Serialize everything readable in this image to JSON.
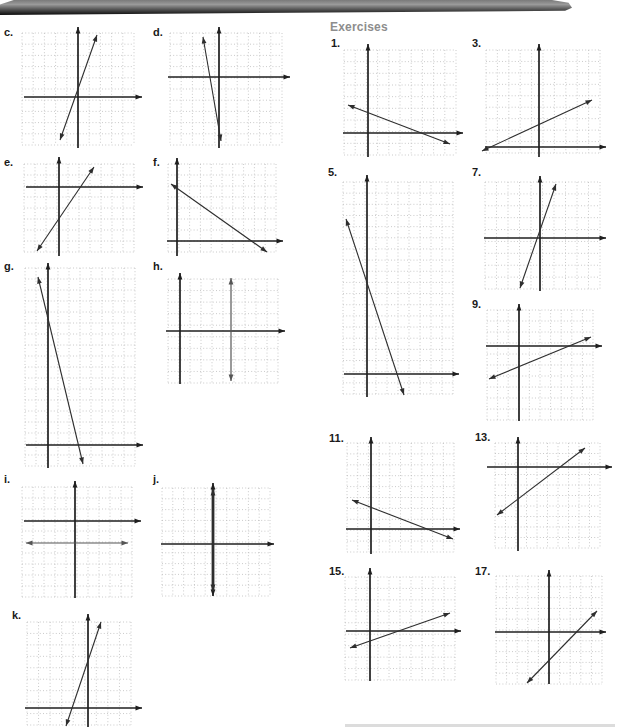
{
  "page": {
    "width": 618,
    "height": 727,
    "background": "#ffffff"
  },
  "header_band": {
    "type": "scanned-page-header",
    "gradient_top": "#9a9a9a",
    "gradient_bottom": "#0b0b0b"
  },
  "headings": {
    "exercises": "Exercises",
    "exercises_color": "#8d8d8d"
  },
  "colors": {
    "axis": "#1f1f1f",
    "plotted_line": "#2e2e2e",
    "secondary_line": "#555555",
    "grid_dot": "#bdbdbd",
    "label": "#1a1a1a"
  },
  "graphs": [
    {
      "label": "c.",
      "lx": 4,
      "ly": 26,
      "grid": {
        "x": 22,
        "y": 33,
        "w": 112,
        "h": 112,
        "cols": 10,
        "rows": 10
      },
      "xaxis": {
        "y": 97,
        "x1": 24,
        "x2": 142,
        "arrow_left": false,
        "arrow_right": true
      },
      "yaxis": {
        "x": 78,
        "y1": 27,
        "y2": 148,
        "arrow_top": true,
        "arrow_bottom": false
      },
      "lines": [
        {
          "x1": 60,
          "y1": 140,
          "x2": 97,
          "y2": 35,
          "arrow_start": true,
          "arrow_end": true,
          "w": 1.1,
          "tone": "plotted_line"
        }
      ]
    },
    {
      "label": "d.",
      "lx": 153,
      "ly": 26,
      "grid": {
        "x": 170,
        "y": 33,
        "w": 112,
        "h": 112,
        "cols": 10,
        "rows": 10
      },
      "xaxis": {
        "y": 77,
        "x1": 168,
        "x2": 290,
        "arrow_left": false,
        "arrow_right": true
      },
      "yaxis": {
        "x": 219,
        "y1": 27,
        "y2": 148,
        "arrow_top": true,
        "arrow_bottom": false
      },
      "lines": [
        {
          "x1": 203,
          "y1": 37,
          "x2": 221,
          "y2": 141,
          "arrow_start": true,
          "arrow_end": true,
          "w": 1.1,
          "tone": "plotted_line"
        }
      ]
    },
    {
      "label": "e.",
      "lx": 4,
      "ly": 156,
      "grid": {
        "x": 24,
        "y": 164,
        "w": 110,
        "h": 88,
        "cols": 10,
        "rows": 8
      },
      "xaxis": {
        "y": 187,
        "x1": 26,
        "x2": 143,
        "arrow_left": false,
        "arrow_right": true
      },
      "yaxis": {
        "x": 59,
        "y1": 157,
        "y2": 256,
        "arrow_top": true,
        "arrow_bottom": false
      },
      "lines": [
        {
          "x1": 37,
          "y1": 251,
          "x2": 94,
          "y2": 167,
          "arrow_start": true,
          "arrow_end": true,
          "w": 1.1,
          "tone": "plotted_line"
        }
      ]
    },
    {
      "label": "f.",
      "lx": 153,
      "ly": 156,
      "grid": {
        "x": 168,
        "y": 164,
        "w": 108,
        "h": 88,
        "cols": 10,
        "rows": 8
      },
      "xaxis": {
        "y": 241,
        "x1": 167,
        "x2": 283,
        "arrow_left": false,
        "arrow_right": true
      },
      "yaxis": {
        "x": 177,
        "y1": 158,
        "y2": 256,
        "arrow_top": true,
        "arrow_bottom": false
      },
      "lines": [
        {
          "x1": 171,
          "y1": 184,
          "x2": 267,
          "y2": 252,
          "arrow_start": true,
          "arrow_end": true,
          "w": 1.1,
          "tone": "plotted_line"
        }
      ]
    },
    {
      "label": "g.",
      "lx": 4,
      "ly": 260,
      "grid": {
        "x": 25,
        "y": 268,
        "w": 110,
        "h": 198,
        "cols": 10,
        "rows": 18
      },
      "xaxis": {
        "y": 445,
        "x1": 26,
        "x2": 143,
        "arrow_left": false,
        "arrow_right": true
      },
      "yaxis": {
        "x": 48,
        "y1": 263,
        "y2": 468,
        "arrow_top": true,
        "arrow_bottom": false
      },
      "lines": [
        {
          "x1": 38,
          "y1": 277,
          "x2": 83,
          "y2": 464,
          "arrow_start": true,
          "arrow_end": true,
          "w": 1.1,
          "tone": "plotted_line"
        }
      ]
    },
    {
      "label": "h.",
      "lx": 153,
      "ly": 260,
      "grid": {
        "x": 168,
        "y": 279,
        "w": 110,
        "h": 104,
        "cols": 10,
        "rows": 9
      },
      "xaxis": {
        "y": 331,
        "x1": 166,
        "x2": 285,
        "arrow_left": false,
        "arrow_right": true
      },
      "yaxis": {
        "x": 180,
        "y1": 273,
        "y2": 384,
        "arrow_top": true,
        "arrow_bottom": false
      },
      "lines": [
        {
          "x1": 231,
          "y1": 278,
          "x2": 231,
          "y2": 381,
          "arrow_start": true,
          "arrow_end": true,
          "w": 1.2,
          "tone": "secondary_line"
        }
      ]
    },
    {
      "label": "i.",
      "lx": 4,
      "ly": 473,
      "grid": {
        "x": 22,
        "y": 487,
        "w": 110,
        "h": 110,
        "cols": 10,
        "rows": 10
      },
      "xaxis": {
        "y": 521,
        "x1": 24,
        "x2": 141,
        "arrow_left": false,
        "arrow_right": true
      },
      "yaxis": {
        "x": 75,
        "y1": 481,
        "y2": 598,
        "arrow_top": true,
        "arrow_bottom": false
      },
      "lines": [
        {
          "x1": 26,
          "y1": 543,
          "x2": 128,
          "y2": 543,
          "arrow_start": true,
          "arrow_end": true,
          "w": 1.2,
          "tone": "secondary_line"
        }
      ]
    },
    {
      "label": "j.",
      "lx": 153,
      "ly": 473,
      "grid": {
        "x": 162,
        "y": 488,
        "w": 108,
        "h": 108,
        "cols": 10,
        "rows": 10
      },
      "xaxis": {
        "y": 544,
        "x1": 161,
        "x2": 274,
        "arrow_left": false,
        "arrow_right": true
      },
      "yaxis": {
        "x": 213,
        "y1": 483,
        "y2": 596,
        "arrow_top": true,
        "arrow_bottom": true
      },
      "lines": [
        {
          "x1": 213,
          "y1": 489,
          "x2": 213,
          "y2": 591,
          "arrow_start": true,
          "arrow_end": true,
          "w": 2.8,
          "tone": "plotted_line"
        }
      ]
    },
    {
      "label": "k.",
      "lx": 12,
      "ly": 609,
      "grid": {
        "x": 27,
        "y": 622,
        "w": 104,
        "h": 103,
        "cols": 9,
        "rows": 9
      },
      "xaxis": {
        "y": 708,
        "x1": 25,
        "x2": 142,
        "arrow_left": false,
        "arrow_right": true
      },
      "yaxis": {
        "x": 88,
        "y1": 614,
        "y2": 727,
        "arrow_top": true,
        "arrow_bottom": false
      },
      "lines": [
        {
          "x1": 66,
          "y1": 726,
          "x2": 101,
          "y2": 622,
          "arrow_start": true,
          "arrow_end": true,
          "w": 1.1,
          "tone": "plotted_line"
        }
      ]
    },
    {
      "label": "1.",
      "lx": 331,
      "ly": 37,
      "grid": {
        "x": 344,
        "y": 50,
        "w": 112,
        "h": 105,
        "cols": 10,
        "rows": 9
      },
      "xaxis": {
        "y": 133,
        "x1": 343,
        "x2": 463,
        "arrow_left": false,
        "arrow_right": true
      },
      "yaxis": {
        "x": 368,
        "y1": 44,
        "y2": 157,
        "arrow_top": true,
        "arrow_bottom": false
      },
      "lines": [
        {
          "x1": 348,
          "y1": 105,
          "x2": 450,
          "y2": 144,
          "arrow_start": true,
          "arrow_end": true,
          "w": 1.1,
          "tone": "plotted_line"
        }
      ]
    },
    {
      "label": "3.",
      "lx": 472,
      "ly": 37,
      "grid": {
        "x": 486,
        "y": 50,
        "w": 114,
        "h": 103,
        "cols": 10,
        "rows": 9
      },
      "xaxis": {
        "y": 147,
        "x1": 485,
        "x2": 606,
        "arrow_left": false,
        "arrow_right": true
      },
      "yaxis": {
        "x": 539,
        "y1": 44,
        "y2": 157,
        "arrow_top": true,
        "arrow_bottom": false
      },
      "lines": [
        {
          "x1": 482,
          "y1": 151,
          "x2": 592,
          "y2": 100,
          "arrow_start": true,
          "arrow_end": true,
          "w": 1.1,
          "tone": "plotted_line"
        }
      ]
    },
    {
      "label": "5.",
      "lx": 328,
      "ly": 166,
      "grid": {
        "x": 343,
        "y": 182,
        "w": 110,
        "h": 212,
        "cols": 10,
        "rows": 19
      },
      "xaxis": {
        "y": 374,
        "x1": 344,
        "x2": 459,
        "arrow_left": false,
        "arrow_right": true
      },
      "yaxis": {
        "x": 367,
        "y1": 175,
        "y2": 397,
        "arrow_top": true,
        "arrow_bottom": false
      },
      "lines": [
        {
          "x1": 346,
          "y1": 219,
          "x2": 404,
          "y2": 395,
          "arrow_start": true,
          "arrow_end": true,
          "w": 1.1,
          "tone": "plotted_line"
        }
      ]
    },
    {
      "label": "7.",
      "lx": 472,
      "ly": 166,
      "grid": {
        "x": 485,
        "y": 182,
        "w": 115,
        "h": 107,
        "cols": 10,
        "rows": 9
      },
      "xaxis": {
        "y": 238,
        "x1": 484,
        "x2": 606,
        "arrow_left": false,
        "arrow_right": true
      },
      "yaxis": {
        "x": 540,
        "y1": 176,
        "y2": 291,
        "arrow_top": true,
        "arrow_bottom": false
      },
      "lines": [
        {
          "x1": 520,
          "y1": 288,
          "x2": 556,
          "y2": 184,
          "arrow_start": true,
          "arrow_end": true,
          "w": 1.1,
          "tone": "plotted_line"
        }
      ]
    },
    {
      "label": "9.",
      "lx": 472,
      "ly": 298,
      "grid": {
        "x": 487,
        "y": 310,
        "w": 106,
        "h": 110,
        "cols": 10,
        "rows": 10
      },
      "xaxis": {
        "y": 346,
        "x1": 486,
        "x2": 602,
        "arrow_left": false,
        "arrow_right": true
      },
      "yaxis": {
        "x": 519,
        "y1": 304,
        "y2": 421,
        "arrow_top": true,
        "arrow_bottom": false
      },
      "lines": [
        {
          "x1": 489,
          "y1": 379,
          "x2": 591,
          "y2": 337,
          "arrow_start": true,
          "arrow_end": true,
          "w": 1.1,
          "tone": "plotted_line"
        }
      ]
    },
    {
      "label": "11.",
      "lx": 329,
      "ly": 432,
      "grid": {
        "x": 347,
        "y": 443,
        "w": 107,
        "h": 109,
        "cols": 10,
        "rows": 10
      },
      "xaxis": {
        "y": 529,
        "x1": 346,
        "x2": 460,
        "arrow_left": false,
        "arrow_right": true
      },
      "yaxis": {
        "x": 371,
        "y1": 437,
        "y2": 554,
        "arrow_top": true,
        "arrow_bottom": false
      },
      "lines": [
        {
          "x1": 352,
          "y1": 500,
          "x2": 453,
          "y2": 539,
          "arrow_start": true,
          "arrow_end": true,
          "w": 1.1,
          "tone": "plotted_line"
        }
      ]
    },
    {
      "label": "13.",
      "lx": 475,
      "ly": 431,
      "grid": {
        "x": 495,
        "y": 443,
        "w": 105,
        "h": 105,
        "cols": 10,
        "rows": 10
      },
      "xaxis": {
        "y": 467,
        "x1": 487,
        "x2": 612,
        "arrow_left": false,
        "arrow_right": true
      },
      "yaxis": {
        "x": 518,
        "y1": 437,
        "y2": 551,
        "arrow_top": true,
        "arrow_bottom": false
      },
      "lines": [
        {
          "x1": 497,
          "y1": 515,
          "x2": 585,
          "y2": 448,
          "arrow_start": true,
          "arrow_end": true,
          "w": 1.1,
          "tone": "plotted_line"
        }
      ]
    },
    {
      "label": "15.",
      "lx": 329,
      "ly": 565,
      "grid": {
        "x": 345,
        "y": 577,
        "w": 110,
        "h": 103,
        "cols": 10,
        "rows": 9
      },
      "xaxis": {
        "y": 631,
        "x1": 346,
        "x2": 461,
        "arrow_left": false,
        "arrow_right": true
      },
      "yaxis": {
        "x": 370,
        "y1": 568,
        "y2": 681,
        "arrow_top": true,
        "arrow_bottom": false
      },
      "lines": [
        {
          "x1": 350,
          "y1": 648,
          "x2": 450,
          "y2": 613,
          "arrow_start": true,
          "arrow_end": true,
          "w": 1.1,
          "tone": "plotted_line"
        }
      ]
    },
    {
      "label": "17.",
      "lx": 475,
      "ly": 565,
      "grid": {
        "x": 496,
        "y": 576,
        "w": 106,
        "h": 108,
        "cols": 10,
        "rows": 10
      },
      "xaxis": {
        "y": 632,
        "x1": 495,
        "x2": 606,
        "arrow_left": false,
        "arrow_right": true
      },
      "yaxis": {
        "x": 549,
        "y1": 570,
        "y2": 684,
        "arrow_top": true,
        "arrow_bottom": false
      },
      "lines": [
        {
          "x1": 527,
          "y1": 683,
          "x2": 597,
          "y2": 611,
          "arrow_start": true,
          "arrow_end": true,
          "w": 1.1,
          "tone": "plotted_line"
        }
      ]
    }
  ]
}
